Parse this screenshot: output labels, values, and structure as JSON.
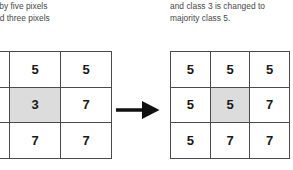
{
  "figure": {
    "caption_left": {
      "lines": [
        "rounded by five pixels",
        "lass 5 and three pixels",
        "lass 7."
      ]
    },
    "caption_right": {
      "lines": [
        "and class 3 is changed to",
        "majority class 5."
      ]
    },
    "arrow": {
      "icon": "right-arrow-icon",
      "color": "#111111"
    },
    "style": {
      "grid_line_color": "#4a4a4a",
      "shaded_cell_color": "#dcdcdc",
      "digit_color": "#181818",
      "text_color": "#474747",
      "background": "#ffffff"
    },
    "grid_before": {
      "rows": [
        [
          {
            "value": "5",
            "shaded": false
          },
          {
            "value": "5",
            "shaded": false
          },
          {
            "value": "5",
            "shaded": false
          }
        ],
        [
          {
            "value": "5",
            "shaded": false
          },
          {
            "value": "3",
            "shaded": true
          },
          {
            "value": "7",
            "shaded": false
          }
        ],
        [
          {
            "value": "5",
            "shaded": false
          },
          {
            "value": "7",
            "shaded": false
          },
          {
            "value": "7",
            "shaded": false
          }
        ]
      ]
    },
    "grid_after": {
      "rows": [
        [
          {
            "value": "5",
            "shaded": false
          },
          {
            "value": "5",
            "shaded": false
          },
          {
            "value": "5",
            "shaded": false
          }
        ],
        [
          {
            "value": "5",
            "shaded": false
          },
          {
            "value": "5",
            "shaded": true
          },
          {
            "value": "7",
            "shaded": false
          }
        ],
        [
          {
            "value": "5",
            "shaded": false
          },
          {
            "value": "7",
            "shaded": false
          },
          {
            "value": "7",
            "shaded": false
          }
        ]
      ]
    }
  }
}
